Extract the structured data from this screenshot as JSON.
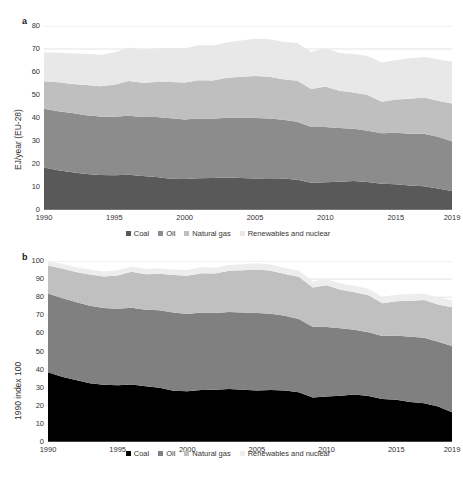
{
  "figure": {
    "panels": [
      {
        "letter": "a",
        "ylabel": "EJ/year (EU-28)",
        "yticks": [
          "0",
          "10",
          "20",
          "30",
          "40",
          "50",
          "60",
          "70",
          "80"
        ],
        "xticks": [
          "1990",
          "1995",
          "2000",
          "2005",
          "2010",
          "2015",
          "2019"
        ]
      },
      {
        "letter": "b",
        "ylabel": "1990 index 100",
        "yticks": [
          "0",
          "10",
          "20",
          "30",
          "40",
          "50",
          "60",
          "70",
          "80",
          "90",
          "100"
        ],
        "xticks": [
          "1990",
          "1995",
          "2000",
          "2005",
          "2010",
          "2015",
          "2019"
        ]
      }
    ],
    "legend_a": [
      {
        "label": "Coal",
        "color": "#595959"
      },
      {
        "label": "Oil",
        "color": "#8c8c8c"
      },
      {
        "label": "Natural gas",
        "color": "#bfbfbf"
      },
      {
        "label": "Renewables and nuclear",
        "color": "#e8e8e8"
      }
    ],
    "legend_b": [
      {
        "label": "Coal",
        "color": "#000000"
      },
      {
        "label": "Oil",
        "color": "#808080"
      },
      {
        "label": "Natural gas",
        "color": "#c0c0c0"
      },
      {
        "label": "Renewables and nuclear",
        "color": "#ededed"
      }
    ]
  },
  "chart_data": [
    {
      "type": "area",
      "stacked": true,
      "panel": "a",
      "title": "",
      "xlabel": "",
      "ylabel": "EJ/year (EU-28)",
      "xlim": [
        1990,
        2019
      ],
      "ylim": [
        0,
        80
      ],
      "ytick_step": 10,
      "grid": "horizontal",
      "legend_position": "bottom",
      "x": [
        1990,
        1991,
        1992,
        1993,
        1994,
        1995,
        1996,
        1997,
        1998,
        1999,
        2000,
        2001,
        2002,
        2003,
        2004,
        2005,
        2006,
        2007,
        2008,
        2009,
        2010,
        2011,
        2012,
        2013,
        2014,
        2015,
        2016,
        2017,
        2018,
        2019
      ],
      "series": [
        {
          "name": "Coal",
          "color": "#595959",
          "values": [
            18.5,
            17.3,
            16.4,
            15.6,
            15.2,
            15.1,
            15.3,
            14.8,
            14.4,
            13.6,
            13.5,
            13.8,
            13.9,
            14.1,
            13.9,
            13.7,
            13.8,
            13.7,
            13.2,
            11.8,
            12.1,
            12.3,
            12.6,
            12.2,
            11.4,
            11.2,
            10.6,
            10.3,
            9.4,
            8.3
          ]
        },
        {
          "name": "Oil",
          "color": "#8c8c8c",
          "values": [
            25.5,
            25.6,
            25.8,
            25.6,
            25.4,
            25.4,
            25.7,
            25.6,
            26.0,
            26.3,
            25.8,
            26.0,
            25.8,
            26.0,
            26.2,
            26.3,
            26.0,
            25.5,
            25.2,
            24.3,
            24.0,
            23.4,
            22.7,
            22.3,
            22.0,
            22.4,
            22.6,
            22.8,
            22.4,
            21.6
          ]
        },
        {
          "name": "Natural gas",
          "color": "#bfbfbf",
          "values": [
            12.0,
            12.6,
            12.6,
            13.2,
            13.2,
            14.0,
            15.1,
            14.9,
            15.3,
            15.8,
            16.1,
            16.6,
            16.6,
            17.4,
            17.8,
            18.3,
            18.1,
            17.6,
            17.8,
            16.5,
            17.6,
            16.2,
            15.8,
            15.5,
            13.7,
            14.4,
            15.2,
            15.8,
            15.7,
            16.4
          ]
        },
        {
          "name": "Renewables and nuclear",
          "color": "#e8e8e8",
          "values": [
            12.5,
            12.9,
            13.2,
            13.5,
            13.7,
            14.0,
            14.5,
            14.4,
            14.6,
            14.6,
            14.9,
            15.2,
            15.2,
            15.3,
            15.8,
            16.2,
            16.3,
            16.3,
            16.4,
            16.1,
            16.7,
            16.4,
            16.7,
            17.0,
            17.0,
            17.1,
            17.6,
            17.6,
            18.0,
            18.2
          ]
        }
      ]
    },
    {
      "type": "area",
      "stacked": true,
      "panel": "b",
      "title": "",
      "xlabel": "",
      "ylabel": "1990 index 100",
      "xlim": [
        1990,
        2019
      ],
      "ylim": [
        0,
        100
      ],
      "ytick_step": 10,
      "grid": "horizontal",
      "legend_position": "bottom",
      "x": [
        1990,
        1991,
        1992,
        1993,
        1994,
        1995,
        1996,
        1997,
        1998,
        1999,
        2000,
        2001,
        2002,
        2003,
        2004,
        2005,
        2006,
        2007,
        2008,
        2009,
        2010,
        2011,
        2012,
        2013,
        2014,
        2015,
        2016,
        2017,
        2018,
        2019
      ],
      "series": [
        {
          "name": "Coal",
          "color": "#000000",
          "values": [
            38.5,
            36.0,
            34.2,
            32.5,
            31.6,
            31.4,
            31.8,
            30.8,
            30.0,
            28.3,
            28.1,
            28.7,
            28.9,
            29.3,
            28.9,
            28.5,
            28.7,
            28.5,
            27.5,
            24.6,
            25.2,
            25.6,
            26.2,
            25.4,
            23.7,
            23.3,
            22.1,
            21.4,
            19.6,
            16.5
          ]
        },
        {
          "name": "Oil",
          "color": "#808080",
          "values": [
            43.5,
            43.6,
            43.2,
            42.8,
            42.4,
            42.2,
            42.4,
            42.3,
            42.8,
            43.2,
            42.6,
            42.8,
            42.4,
            42.5,
            42.7,
            42.8,
            42.2,
            41.2,
            40.5,
            39.1,
            38.4,
            37.2,
            35.8,
            35.3,
            34.9,
            35.6,
            36.0,
            36.2,
            35.8,
            36.5
          ]
        },
        {
          "name": "Natural gas",
          "color": "#c0c0c0",
          "values": [
            15.5,
            16.3,
            16.5,
            17.2,
            17.4,
            18.4,
            19.8,
            19.6,
            20.2,
            20.8,
            21.2,
            21.8,
            21.8,
            22.8,
            23.3,
            24.0,
            23.7,
            23.1,
            23.3,
            21.7,
            23.0,
            21.3,
            20.8,
            20.4,
            18.1,
            18.9,
            20.0,
            20.8,
            20.6,
            21.5
          ]
        },
        {
          "name": "Renewables and nuclear",
          "color": "#ededed",
          "values": [
            2.5,
            2.6,
            2.7,
            2.8,
            2.8,
            2.9,
            3.0,
            3.0,
            3.0,
            3.0,
            3.1,
            3.2,
            3.2,
            3.2,
            3.3,
            3.4,
            3.4,
            3.4,
            3.4,
            3.4,
            3.5,
            3.5,
            3.5,
            3.6,
            3.6,
            3.6,
            3.7,
            3.7,
            3.8,
            3.9
          ]
        }
      ]
    }
  ]
}
